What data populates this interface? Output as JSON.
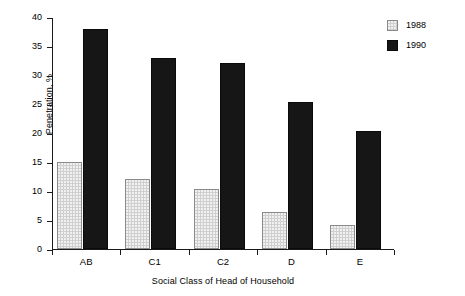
{
  "chart_data": {
    "type": "bar",
    "title": "",
    "xlabel": "Social Class of Head of Household",
    "ylabel": "Penetration, %",
    "categories": [
      "AB",
      "C1",
      "C2",
      "D",
      "E"
    ],
    "series": [
      {
        "name": "1988",
        "color": "#cfcfcf",
        "values": [
          15.0,
          12.0,
          10.3,
          6.3,
          4.2
        ]
      },
      {
        "name": "1990",
        "color": "#161616",
        "values": [
          37.9,
          33.0,
          32.0,
          25.3,
          20.4
        ]
      }
    ],
    "ylim": [
      0,
      40
    ],
    "ytick_step": 5,
    "ytick_labels": [
      "0",
      "5",
      "10",
      "15",
      "20",
      "25",
      "30",
      "35",
      "40"
    ],
    "grid": false,
    "legend_position": "top-right",
    "legend_entries": [
      "1988",
      "1990"
    ]
  }
}
